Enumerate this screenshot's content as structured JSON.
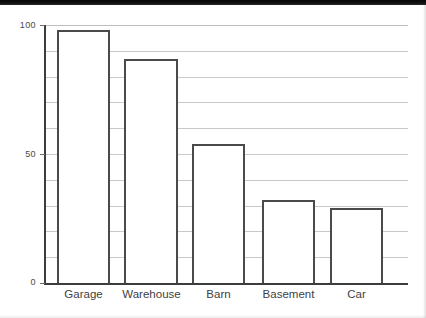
{
  "chart_data": {
    "type": "bar",
    "title": "",
    "subtitle": "",
    "xlabel": "",
    "ylabel": "",
    "categories": [
      "Garage",
      "Warehouse",
      "Barn",
      "Basement",
      "Car"
    ],
    "values": [
      98,
      87,
      54,
      32,
      29
    ],
    "ylim": [
      0,
      100
    ],
    "y_ticks": [
      0,
      10,
      20,
      30,
      40,
      50,
      60,
      70,
      80,
      90,
      100
    ],
    "y_tick_labels": [
      "0",
      "",
      "",
      "",
      "",
      "50",
      "",
      "",
      "",
      "",
      "100"
    ],
    "labeled_y_ticks": [
      {
        "value": 100,
        "label": "100"
      },
      {
        "value": 50,
        "label": "50"
      },
      {
        "value": 0,
        "label": "0"
      }
    ],
    "grid": true,
    "grid_axis": "y",
    "legend": false,
    "legend_position": "none",
    "annotations": [],
    "colors": {
      "bar_fill": "#ffffff",
      "bar_stroke": "#4a4a4a",
      "gridline": "#c9c9c9",
      "axis": "#3d3d3d",
      "text": "#3f3f3f"
    }
  }
}
